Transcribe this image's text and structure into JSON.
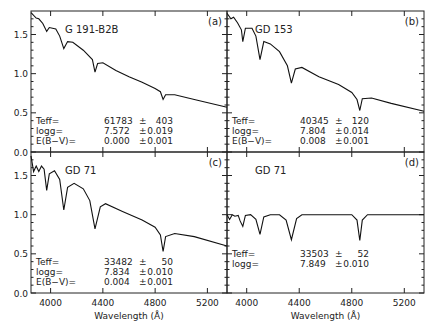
{
  "chart_data": [
    {
      "type": "line",
      "panel": "(a)",
      "star": "G 191-B2B",
      "xlabel": "",
      "ylabel": "",
      "xlim": [
        3850,
        5350
      ],
      "ylim": [
        0.0,
        1.8
      ],
      "yticks": [
        "0.0",
        "0.5",
        "1.0",
        "1.5"
      ],
      "params": {
        "teff": "61783",
        "teff_err": "403",
        "logg": "7.572",
        "logg_err": "0.019",
        "ebv": "0.000",
        "ebv_err": "0.001"
      },
      "series": [
        {
          "name": "G 191-B2B spectrum",
          "x": [
            3850,
            3890,
            3910,
            3940,
            3970,
            3990,
            4040,
            4070,
            4101,
            4130,
            4170,
            4250,
            4320,
            4340,
            4360,
            4400,
            4500,
            4600,
            4700,
            4800,
            4840,
            4861,
            4880,
            4950,
            5100,
            5350
          ],
          "y": [
            1.78,
            1.71,
            1.7,
            1.64,
            1.54,
            1.59,
            1.57,
            1.48,
            1.32,
            1.41,
            1.4,
            1.3,
            1.18,
            1.02,
            1.13,
            1.14,
            1.04,
            0.96,
            0.89,
            0.81,
            0.77,
            0.67,
            0.73,
            0.73,
            0.67,
            0.57
          ]
        }
      ]
    },
    {
      "type": "line",
      "panel": "(b)",
      "star": "GD 153",
      "xlim": [
        3850,
        5350
      ],
      "ylim": [
        0.0,
        1.8
      ],
      "params": {
        "teff": "40345",
        "teff_err": "120",
        "logg": "7.804",
        "logg_err": "0.014",
        "ebv": "0.008",
        "ebv_err": "0.001"
      },
      "series": [
        {
          "name": "GD 153 spectrum",
          "x": [
            3850,
            3880,
            3900,
            3930,
            3960,
            3970,
            3990,
            4040,
            4070,
            4101,
            4130,
            4180,
            4250,
            4310,
            4340,
            4370,
            4420,
            4550,
            4700,
            4800,
            4840,
            4861,
            4880,
            4950,
            5100,
            5350
          ],
          "y": [
            1.77,
            1.7,
            1.72,
            1.65,
            1.56,
            1.41,
            1.58,
            1.58,
            1.48,
            1.18,
            1.41,
            1.38,
            1.28,
            1.1,
            0.88,
            1.06,
            1.08,
            0.96,
            0.86,
            0.76,
            0.67,
            0.53,
            0.68,
            0.69,
            0.62,
            0.52
          ]
        }
      ]
    },
    {
      "type": "line",
      "panel": "(c)",
      "star": "GD 71",
      "xlabel": "Wavelength (Å)",
      "xlim": [
        3850,
        5350
      ],
      "ylim": [
        0.0,
        1.8
      ],
      "xticks": [
        "4000",
        "4400",
        "4800",
        "5200"
      ],
      "yticks": [
        "0.0",
        "0.5",
        "1.0",
        "1.5"
      ],
      "params": {
        "teff": "33482",
        "teff_err": "50",
        "logg": "7.834",
        "logg_err": "0.010",
        "ebv": "0.004",
        "ebv_err": "0.001"
      },
      "series": [
        {
          "name": "GD 71 spectrum",
          "x": [
            3850,
            3870,
            3890,
            3910,
            3930,
            3950,
            3970,
            3990,
            4030,
            4070,
            4101,
            4130,
            4180,
            4250,
            4300,
            4340,
            4380,
            4420,
            4550,
            4700,
            4800,
            4840,
            4861,
            4880,
            4950,
            5100,
            5350
          ],
          "y": [
            1.75,
            1.55,
            1.62,
            1.55,
            1.62,
            1.58,
            1.31,
            1.52,
            1.56,
            1.45,
            1.06,
            1.35,
            1.4,
            1.33,
            1.18,
            0.82,
            1.1,
            1.14,
            1.04,
            0.93,
            0.84,
            0.74,
            0.53,
            0.72,
            0.76,
            0.72,
            0.6
          ]
        }
      ]
    },
    {
      "type": "line",
      "panel": "(d)",
      "star": "GD 71",
      "xlabel": "Wavelength (Å)",
      "xlim": [
        3850,
        5350
      ],
      "ylim": [
        0.0,
        1.8
      ],
      "xticks": [
        "4000",
        "4400",
        "4800",
        "5200"
      ],
      "params": {
        "teff": "33503",
        "teff_err": "52",
        "logg": "7.849",
        "logg_err": "0.010"
      },
      "series": [
        {
          "name": "GD 71 normalized spectrum",
          "x": [
            3850,
            3870,
            3890,
            3910,
            3935,
            3950,
            3970,
            3990,
            4030,
            4070,
            4101,
            4130,
            4180,
            4250,
            4300,
            4340,
            4380,
            4420,
            4600,
            4800,
            4840,
            4861,
            4880,
            4920,
            5100,
            5350
          ],
          "y": [
            1.0,
            0.94,
            1.0,
            0.98,
            0.99,
            0.92,
            0.85,
            0.99,
            1.0,
            0.94,
            0.75,
            0.97,
            1.0,
            1.0,
            0.93,
            0.68,
            0.95,
            1.0,
            1.0,
            1.0,
            0.93,
            0.67,
            0.93,
            1.0,
            1.0,
            1.0
          ]
        }
      ]
    }
  ],
  "labels": {
    "teff": "Teff=",
    "logg": "logg=",
    "ebv": "E(B−V)=",
    "pm": "±",
    "xlabel": "Wavelength (Å)"
  }
}
